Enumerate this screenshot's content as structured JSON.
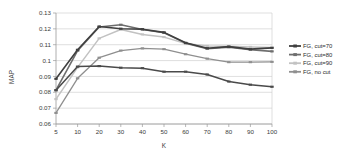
{
  "chart_data": {
    "type": "line",
    "title": "",
    "xlabel": "K",
    "ylabel": "MAP",
    "x": [
      5,
      10,
      20,
      30,
      40,
      50,
      60,
      70,
      80,
      90,
      100
    ],
    "xtick_labels": [
      "5",
      "10",
      "20",
      "30",
      "40",
      "50",
      "60",
      "70",
      "80",
      "90",
      "100"
    ],
    "ytick_labels": [
      "0.06",
      "0.07",
      "0.08",
      "0.09",
      "0.1",
      "0.11",
      "0.12",
      "0.13"
    ],
    "ytick_values": [
      0.06,
      0.07,
      0.08,
      0.09,
      0.1,
      0.11,
      0.12,
      0.13
    ],
    "ylim": [
      0.06,
      0.13
    ],
    "grid": true,
    "legend_position": "right",
    "series": [
      {
        "name": "FG, cut=70",
        "color": "#3f3f3f",
        "values": [
          0.0885,
          0.1068,
          0.1215,
          0.1201,
          0.1198,
          0.1178,
          0.1112,
          0.1078,
          0.1088,
          0.1072,
          0.108
        ]
      },
      {
        "name": "FG, cut=80",
        "color": "#6e6e6e",
        "values": [
          0.0813,
          0.1062,
          0.1212,
          0.1226,
          0.1196,
          0.1175,
          0.111,
          0.1075,
          0.1085,
          0.1068,
          0.1058
        ]
      },
      {
        "name": "FG, cut=90",
        "color": "#c2c2c2",
        "values": [
          0.0757,
          0.0957,
          0.114,
          0.1196,
          0.1165,
          0.1148,
          0.1108,
          0.1092,
          0.109,
          0.1086,
          0.1083
        ]
      },
      {
        "name": "FG, no cut",
        "color": "#8f8f8f",
        "values": [
          0.067,
          0.0888,
          0.1018,
          0.1063,
          0.1077,
          0.1072,
          0.104,
          0.1012,
          0.099,
          0.099,
          0.0992
        ]
      }
    ],
    "extra_series": [
      {
        "name": "dark-low-curve",
        "color": "#4a4a4a",
        "values": [
          0.0813,
          0.0962,
          0.0965,
          0.0955,
          0.0952,
          0.093,
          0.093,
          0.0912,
          0.0868,
          0.0848,
          0.0835
        ]
      }
    ]
  },
  "legend": {
    "items": [
      {
        "label": "FG, cut=70",
        "color": "#3f3f3f"
      },
      {
        "label": "FG, cut=80",
        "color": "#6e6e6e"
      },
      {
        "label": "FG, cut=90",
        "color": "#c2c2c2"
      },
      {
        "label": "FG, no cut",
        "color": "#8f8f8f"
      }
    ]
  }
}
